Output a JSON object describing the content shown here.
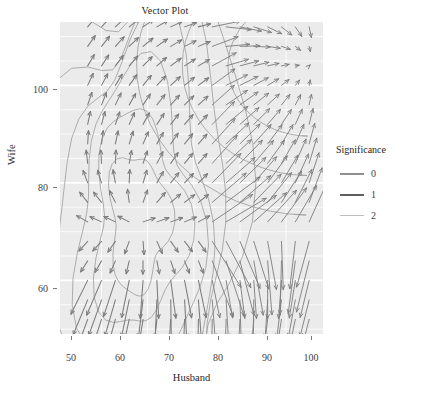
{
  "plot": {
    "title": "Vector Plot",
    "background_panel": "#ebebeb",
    "grid_color": "#ffffff",
    "page_background": "#ffffff"
  },
  "axes": {
    "x": {
      "label": "Husband",
      "ticks": [
        50,
        60,
        70,
        80,
        90,
        100
      ],
      "tick_labels": [
        "50",
        "60",
        "70",
        "80",
        "90",
        "100"
      ],
      "range": [
        46,
        103
      ]
    },
    "y": {
      "label": "Wife",
      "ticks": [
        60,
        80,
        100
      ],
      "tick_labels": [
        "60",
        "80",
        "100"
      ],
      "range": [
        49,
        113
      ]
    }
  },
  "legend": {
    "title": "Significance",
    "items": [
      {
        "label": "0",
        "color": "#8f8f8f"
      },
      {
        "label": "1",
        "color": "#5e5e5e"
      },
      {
        "label": "2",
        "color": "#bdbdbd"
      }
    ]
  },
  "chart_data": {
    "type": "scatter",
    "title": "Vector Plot",
    "xlabel": "Husband",
    "ylabel": "Wife",
    "xlim": [
      46,
      103
    ],
    "ylim": [
      49,
      113
    ],
    "grid": true,
    "legend_position": "right",
    "legend_title": "Significance",
    "series": [
      {
        "name": "0",
        "color": "#8f8f8f"
      },
      {
        "name": "1",
        "color": "#5e5e5e"
      },
      {
        "name": "2",
        "color": "#bdbdbd"
      }
    ],
    "vector_field": {
      "grid_x": [
        52,
        55,
        58,
        61,
        64,
        67,
        70,
        73,
        76,
        79,
        82,
        85,
        88,
        91,
        94,
        97,
        100
      ],
      "grid_y": [
        52,
        56,
        60,
        64,
        68,
        72,
        76,
        80,
        84,
        88,
        92,
        96,
        100,
        104,
        108,
        112
      ],
      "focus_point": [
        100,
        104
      ],
      "source_point": [
        63,
        72
      ],
      "arrow_color": "#7c7c7c"
    },
    "contours": {
      "color": "#9a9a9a",
      "levels": 6
    }
  }
}
